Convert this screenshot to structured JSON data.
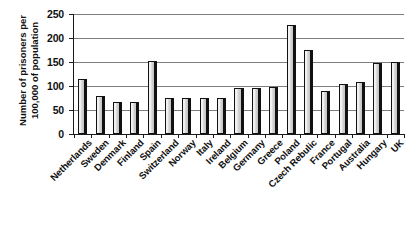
{
  "chart_data": {
    "type": "bar",
    "title": "",
    "subtitle": "",
    "xlabel": "",
    "ylabel": "Number of prisoners per 100,000 of population",
    "ylabel_lines": [
      "Number of prisoners per",
      "100,000 of population"
    ],
    "ylim": [
      0,
      250
    ],
    "yticks": [
      0,
      50,
      100,
      150,
      200,
      250
    ],
    "ytick_labels": [
      "0",
      "50",
      "100",
      "150",
      "200",
      "250"
    ],
    "grid": true,
    "grid_axis": "y",
    "legend": false,
    "legend_position": "none",
    "bar_fill_color": "#e2e2e2",
    "bar_edge_color": "#111111",
    "background_color": "#ffffff",
    "categories": [
      "Netherlands",
      "Sweden",
      "Denmark",
      "Finland",
      "Spain",
      "Switzerland",
      "Norway",
      "Italy",
      "Ireland",
      "Belgium",
      "Germany",
      "Greece",
      "Poland",
      "Czech Rebulic",
      "France",
      "Portugal",
      "Australia",
      "Hungary",
      "UK"
    ],
    "values": [
      115,
      80,
      67,
      67,
      152,
      75,
      75,
      75,
      75,
      95,
      95,
      98,
      228,
      175,
      90,
      105,
      108,
      147,
      150
    ]
  }
}
